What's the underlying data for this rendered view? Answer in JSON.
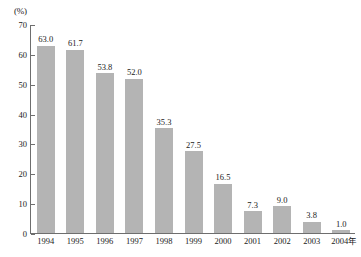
{
  "chart_data": {
    "type": "bar",
    "title": "",
    "subtitle": "",
    "xlabel": "",
    "ylabel": "",
    "unit_label": "(%)",
    "axis_suffix_label": "年",
    "categories": [
      "1994",
      "1995",
      "1996",
      "1997",
      "1998",
      "1999",
      "2000",
      "2001",
      "2002",
      "2003",
      "2004"
    ],
    "values": [
      63.0,
      61.7,
      53.8,
      52.0,
      35.3,
      27.5,
      16.5,
      7.3,
      9.0,
      3.8,
      1.0
    ],
    "value_labels": [
      "63.0",
      "61.7",
      "53.8",
      "52.0",
      "35.3",
      "27.5",
      "16.5",
      "7.3",
      "9.0",
      "3.8",
      "1.0"
    ],
    "tick_labels": [
      "70",
      "60",
      "50",
      "40",
      "30",
      "20",
      "10",
      "0"
    ],
    "tick_values": [
      70,
      60,
      50,
      40,
      30,
      20,
      10,
      0
    ],
    "ylim": [
      0,
      70
    ],
    "grid": false,
    "legend": null,
    "series_color": "#b4b4b4",
    "axis_color": "#6e6e6e",
    "text_color": "#1a1a1a"
  }
}
